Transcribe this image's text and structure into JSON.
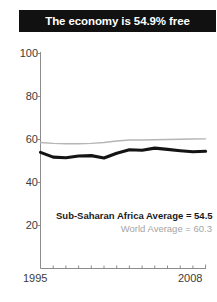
{
  "title": {
    "text": "The economy is 54.9% free"
  },
  "colors": {
    "banner_bg": "#111111",
    "banner_text": "#ffffff",
    "primary_series": "#141414",
    "secondary_series": "#b5b5b5",
    "axis": "#8c8c8c",
    "tick_label": "#3b3b3b",
    "legend_secondary": "#a5a5a5"
  },
  "legend": {
    "primary_label": "Sub-Saharan Africa Average = 54.5",
    "secondary_label": "World Average = 60.3"
  },
  "axes": {
    "y_ticks": [
      "100",
      "80",
      "60",
      "40",
      "20"
    ],
    "x_start_label": "1995",
    "x_end_label": "2008"
  },
  "chart_data": {
    "type": "line",
    "title": "The economy is 54.9% free",
    "xlabel": "",
    "ylabel": "",
    "xlim": [
      1995,
      2008
    ],
    "ylim": [
      0,
      100
    ],
    "yticks": [
      20,
      40,
      60,
      80,
      100
    ],
    "grid": false,
    "legend_position": "inside-lower-right",
    "x": [
      1995,
      1996,
      1997,
      1998,
      1999,
      2000,
      2001,
      2002,
      2003,
      2004,
      2005,
      2006,
      2007,
      2008
    ],
    "series": [
      {
        "name": "Sub-Saharan Africa Average",
        "final_value": 54.5,
        "color": "#141414",
        "values": [
          54.0,
          51.8,
          51.5,
          52.3,
          52.5,
          51.4,
          53.6,
          55.2,
          55.0,
          56.0,
          55.4,
          54.8,
          54.3,
          54.5
        ]
      },
      {
        "name": "World Average",
        "final_value": 60.3,
        "color": "#b5b5b5",
        "values": [
          58.6,
          58.2,
          58.0,
          58.0,
          58.2,
          58.6,
          59.3,
          59.8,
          59.8,
          59.9,
          60.0,
          60.1,
          60.2,
          60.3
        ]
      }
    ],
    "annotations": [
      "Sub-Saharan Africa Average = 54.5",
      "World Average = 60.3"
    ]
  }
}
